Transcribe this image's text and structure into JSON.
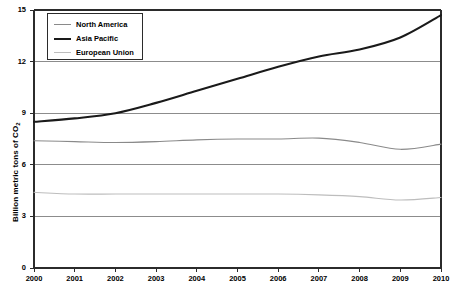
{
  "chart_data": {
    "type": "line",
    "title": "",
    "xlabel": "",
    "ylabel": "Billion metric tons of CO",
    "ylabel_subscript": "2",
    "x": [
      2000,
      2001,
      2002,
      2003,
      2004,
      2005,
      2006,
      2007,
      2008,
      2009,
      2010
    ],
    "xtick_labels": [
      "2000",
      "2001",
      "2002",
      "2003",
      "2004",
      "2005",
      "2006",
      "2007",
      "2008",
      "2009",
      "2010"
    ],
    "ytick_labels": [
      "0",
      "3",
      "6",
      "9",
      "12",
      "15"
    ],
    "yticks": [
      0,
      3,
      6,
      9,
      12,
      15
    ],
    "xlim": [
      2000,
      2010
    ],
    "ylim": [
      0,
      15
    ],
    "grid": true,
    "grid_axis": "y",
    "legend_position": "top-left",
    "series": [
      {
        "name": "North America",
        "color": "#8a8a8a",
        "width": 1.1,
        "values": [
          7.4,
          7.35,
          7.3,
          7.35,
          7.45,
          7.5,
          7.5,
          7.55,
          7.3,
          6.9,
          7.2
        ]
      },
      {
        "name": "Asia Pacific",
        "color": "#1a1a1a",
        "width": 2.1,
        "values": [
          8.5,
          8.7,
          9.0,
          9.6,
          10.3,
          11.0,
          11.7,
          12.3,
          12.7,
          13.4,
          14.7
        ]
      },
      {
        "name": "European Union",
        "color": "#bdbdbd",
        "width": 1.1,
        "values": [
          4.4,
          4.3,
          4.3,
          4.3,
          4.3,
          4.3,
          4.3,
          4.25,
          4.15,
          3.95,
          4.1
        ]
      }
    ]
  },
  "legend": {
    "items": [
      {
        "label": "North America"
      },
      {
        "label": "Asia Pacific"
      },
      {
        "label": "European Union"
      }
    ]
  }
}
